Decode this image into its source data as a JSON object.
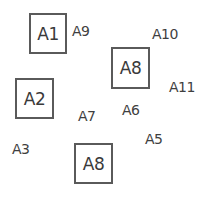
{
  "diagram": {
    "boxed_items": [
      {
        "label": "A1"
      },
      {
        "label": "A2"
      },
      {
        "label": "A8"
      },
      {
        "label": "A8"
      }
    ],
    "free_labels": [
      {
        "label": "A9"
      },
      {
        "label": "A10"
      },
      {
        "label": "A11"
      },
      {
        "label": "A7"
      },
      {
        "label": "A6"
      },
      {
        "label": "A5"
      },
      {
        "label": "A3"
      }
    ]
  }
}
